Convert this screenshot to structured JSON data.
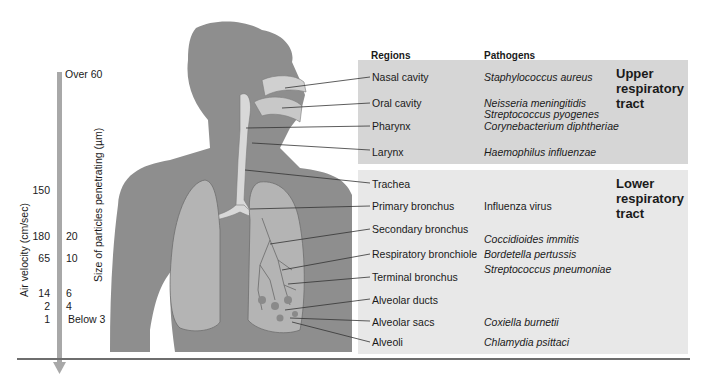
{
  "figure": {
    "column_headers": {
      "regions": "Regions",
      "pathogens": "Pathogens"
    },
    "upper_tract": {
      "label_lines": [
        "Upper",
        "respiratory",
        "tract"
      ],
      "rows": [
        {
          "region": "Nasal cavity",
          "pathogens": [
            "Staphylococcus aureus"
          ]
        },
        {
          "region": "Oral cavity",
          "pathogens": [
            "Neisseria meningitidis",
            "Streptococcus pyogenes"
          ]
        },
        {
          "region": "Pharynx",
          "pathogens": [
            "Corynebacterium diphtheriae"
          ]
        },
        {
          "region": "Larynx",
          "pathogens": [
            "Haemophilus influenzae"
          ]
        }
      ]
    },
    "lower_tract": {
      "label_lines": [
        "Lower",
        "respiratory",
        "tract"
      ],
      "rows": [
        {
          "region": "Trachea",
          "pathogens": []
        },
        {
          "region": "Primary bronchus",
          "pathogens": [
            "Influenza virus"
          ]
        },
        {
          "region": "Secondary bronchus",
          "pathogens": []
        },
        {
          "region": "Respiratory bronchiole",
          "pathogens": [
            "Coccidioides immitis",
            "Bordetella pertussis",
            "Streptococcus pneumoniae"
          ]
        },
        {
          "region": "Terminal bronchus",
          "pathogens": []
        },
        {
          "region": "Alveolar ducts",
          "pathogens": []
        },
        {
          "region": "Alveolar sacs",
          "pathogens": [
            "Coxiella burnetii"
          ]
        },
        {
          "region": "Alveoli",
          "pathogens": [
            "Chlamydia psittaci"
          ]
        }
      ]
    },
    "scale": {
      "air_velocity_label": "Air velocity (cm/sec)",
      "particle_size_label": "Size of particles penetrating (µm)",
      "air_velocity_values": [
        "150",
        "180",
        "65",
        "14",
        "2",
        "1"
      ],
      "particle_size_values": [
        "Over 60",
        "20",
        "10",
        "6",
        "4",
        "Below 3"
      ]
    },
    "colors": {
      "silhouette": "#8e8e8e",
      "upper_panel": "#d6d6d6",
      "lower_panel": "#e8e8e8",
      "arrow": "#a8a8a8",
      "lung": "#b4b4b4",
      "airway": "#d8d8d8"
    }
  }
}
